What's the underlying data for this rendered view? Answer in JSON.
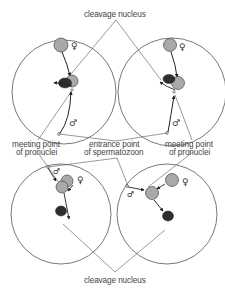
{
  "labels": {
    "cleavage_top": "cleavage nucleus",
    "cleavage_bottom": "cleavage nucleus",
    "meeting_left_1": "meeting point",
    "meeting_left_2": "of pronuclei",
    "entrance_1": "entrance point",
    "entrance_2": "of spermatozoon",
    "meeting_right_1": "meeting point",
    "meeting_right_2": "of pronuclei"
  },
  "symbols": {
    "female": "♀",
    "male": "♂"
  },
  "colors": {
    "pronucleus_fill": "#a9a9a9",
    "cleavage_fill": "#2e2e2e",
    "stroke": "#333333",
    "egg_outline": "#555555"
  },
  "eggs": [
    {
      "id": "top-left",
      "cx": 64,
      "cy": 92,
      "r": 52
    },
    {
      "id": "top-right",
      "cx": 172,
      "cy": 92,
      "r": 54
    },
    {
      "id": "bottom-left",
      "cx": 61,
      "cy": 214,
      "r": 50
    },
    {
      "id": "bottom-right",
      "cx": 167,
      "cy": 214,
      "r": 50
    }
  ]
}
